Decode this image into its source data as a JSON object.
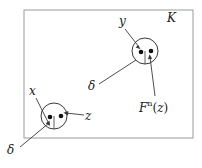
{
  "figure": {
    "caption_free": true,
    "region_label": "K",
    "labels": {
      "y": "y",
      "x": "x",
      "z": "z",
      "delta_upper": "δ",
      "delta_lower": "δ",
      "fnz_base": "F",
      "fnz_exponent": "n",
      "fnz_open": "(",
      "fnz_arg": "z",
      "fnz_close": ")"
    },
    "colors": {
      "stroke": "#3a3a3a",
      "box_stroke": "#999999",
      "dot_fill": "#111111",
      "background": "#ffffff"
    },
    "geometry": {
      "box": {
        "x": 24,
        "y": 10,
        "width": 169,
        "height": 128
      },
      "circle_upper": {
        "cx": 145,
        "cy": 51,
        "r": 13
      },
      "circle_lower": {
        "cx": 54,
        "cy": 116,
        "r": 13
      },
      "dots_upper": [
        {
          "cx": 141,
          "cy": 52
        },
        {
          "cx": 151,
          "cy": 51
        }
      ],
      "dots_lower": [
        {
          "cx": 50,
          "cy": 117
        },
        {
          "cx": 61,
          "cy": 116
        }
      ]
    }
  }
}
